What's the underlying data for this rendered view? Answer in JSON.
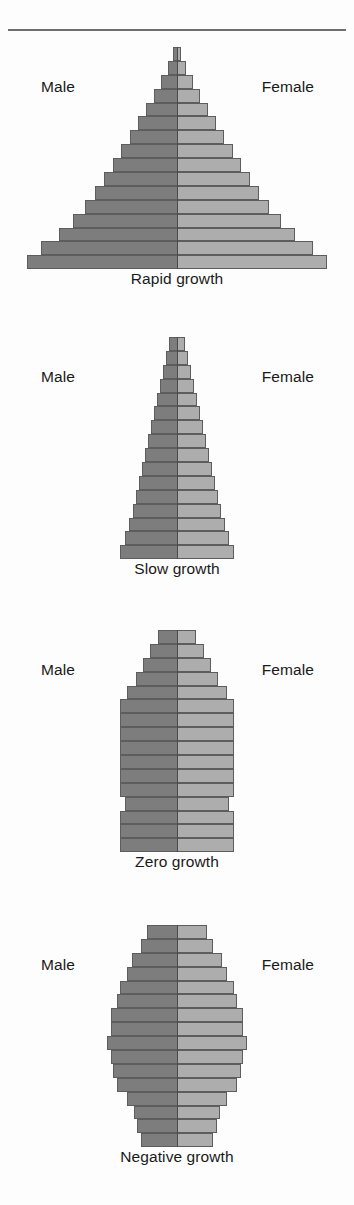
{
  "figure": {
    "title_rule": "horizontal-divider",
    "axis_center_x": 177,
    "colors": {
      "male_fill": "#7d7d7d",
      "female_fill": "#adadad",
      "bar_outline": "#5d5d5d",
      "text": "#1a1a1a",
      "rule": "#6f6f6f",
      "background": "#ffffff"
    }
  },
  "labels": {
    "male": "Male",
    "female": "Female"
  },
  "chart_data": [
    {
      "type": "bar",
      "title": "Rapid growth",
      "orientation": "population-pyramid",
      "xlabel": "",
      "ylabel": "",
      "legend": [
        "Male",
        "Female"
      ],
      "series": [
        {
          "name": "Male",
          "values": [
            4,
            9,
            16,
            23,
            31,
            39,
            47,
            56,
            64,
            73,
            82,
            92,
            104,
            118,
            136,
            150
          ]
        },
        {
          "name": "Female",
          "values": [
            4,
            9,
            16,
            23,
            31,
            39,
            47,
            56,
            64,
            73,
            82,
            92,
            104,
            118,
            136,
            150
          ]
        }
      ],
      "bar_count": 16,
      "shape": "wide-based triangle",
      "top_y": 47,
      "bottom_y": 269,
      "row_height": 13.9
    },
    {
      "type": "bar",
      "title": "Slow growth",
      "orientation": "population-pyramid",
      "xlabel": "",
      "ylabel": "",
      "legend": [
        "Male",
        "Female"
      ],
      "series": [
        {
          "name": "Male",
          "values": [
            8,
            11,
            14,
            17,
            20,
            23,
            26,
            29,
            32,
            35,
            38,
            41,
            44,
            48,
            52,
            57
          ]
        },
        {
          "name": "Female",
          "values": [
            8,
            11,
            14,
            17,
            20,
            23,
            26,
            29,
            32,
            35,
            38,
            41,
            44,
            48,
            52,
            57
          ]
        }
      ],
      "bar_count": 16,
      "shape": "narrow tapering triangle",
      "top_y": 337,
      "bottom_y": 559,
      "row_height": 13.9
    },
    {
      "type": "bar",
      "title": "Zero growth",
      "orientation": "population-pyramid",
      "xlabel": "",
      "ylabel": "",
      "legend": [
        "Male",
        "Female"
      ],
      "series": [
        {
          "name": "Male",
          "values": [
            19,
            27,
            34,
            41,
            50,
            57,
            57,
            57,
            57,
            57,
            57,
            57,
            52,
            57,
            57,
            57
          ]
        },
        {
          "name": "Female",
          "values": [
            19,
            27,
            34,
            41,
            50,
            57,
            57,
            57,
            57,
            57,
            57,
            57,
            52,
            57,
            57,
            57
          ]
        }
      ],
      "bar_count": 16,
      "shape": "rectangular column with rounded top",
      "top_y": 630,
      "bottom_y": 852,
      "row_height": 13.9
    },
    {
      "type": "bar",
      "title": "Negative growth",
      "orientation": "population-pyramid",
      "xlabel": "",
      "ylabel": "",
      "legend": [
        "Male",
        "Female"
      ],
      "series": [
        {
          "name": "Male",
          "values": [
            30,
            36,
            45,
            50,
            57,
            60,
            66,
            66,
            70,
            66,
            64,
            60,
            50,
            43,
            40,
            36
          ]
        },
        {
          "name": "Female",
          "values": [
            30,
            36,
            45,
            50,
            57,
            60,
            66,
            66,
            70,
            66,
            64,
            60,
            50,
            43,
            40,
            36
          ]
        }
      ],
      "bar_count": 16,
      "shape": "barrel / inverted-bulb",
      "top_y": 925,
      "bottom_y": 1147,
      "row_height": 13.9
    }
  ],
  "captions": {
    "rapid": "Rapid growth",
    "slow": "Slow growth",
    "zero": "Zero growth",
    "negative": "Negative growth"
  }
}
